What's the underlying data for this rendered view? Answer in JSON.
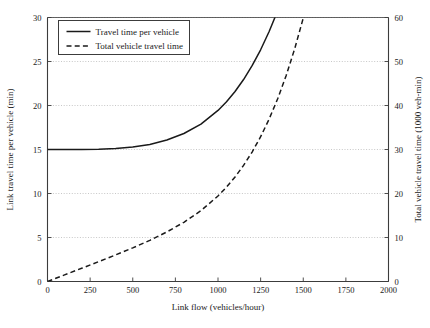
{
  "chart_data": {
    "type": "line",
    "title": "",
    "subtitle": "",
    "xlabel": "Link flow (vehicles/hour)",
    "ylabel": "Link travel time per vehicle (min)",
    "y2label": "Total vehicle travel time (1000 veh-min)",
    "xlim": [
      0,
      2000
    ],
    "ylim": [
      0,
      30
    ],
    "y2lim": [
      0,
      60
    ],
    "xticks": [
      0,
      250,
      500,
      750,
      1000,
      1250,
      1500,
      1750,
      2000
    ],
    "xticklabels": [
      "0",
      "250",
      "500",
      "750",
      "1000",
      "1250",
      "1500",
      "1750",
      "2000"
    ],
    "yticks": [
      0,
      5,
      10,
      15,
      20,
      25,
      30
    ],
    "yticklabels": [
      "0",
      "5",
      "10",
      "15",
      "20",
      "25",
      "30"
    ],
    "y2ticks": [
      0,
      10,
      20,
      30,
      40,
      50,
      60
    ],
    "y2ticklabels": [
      "0",
      "10",
      "20",
      "30",
      "40",
      "50",
      "60"
    ],
    "grid": true,
    "grid_style": "dotted-horizontal",
    "legend_position": "top-left",
    "legend": [
      "Travel time per vehicle",
      "Total vehicle travel time"
    ],
    "series": [
      {
        "name": "Travel time per vehicle",
        "axis": "left",
        "style": "solid",
        "color": "#1a1a1a",
        "x": [
          0,
          100,
          200,
          300,
          400,
          500,
          600,
          700,
          800,
          900,
          1000,
          1050,
          1100,
          1150,
          1200,
          1250,
          1300,
          1350,
          1400,
          1450,
          1500,
          1550,
          1600,
          1610
        ],
        "y": [
          15.0,
          15.0,
          15.01,
          15.04,
          15.12,
          15.28,
          15.58,
          16.08,
          16.82,
          17.89,
          19.44,
          20.43,
          21.59,
          22.95,
          24.52,
          26.33,
          28.41,
          30.77,
          33.46,
          36.49,
          39.91,
          43.73,
          48.0,
          48.93
        ]
      },
      {
        "name": "Total vehicle travel time",
        "axis": "right",
        "style": "dashed",
        "color": "#1a1a1a",
        "x": [
          0,
          100,
          200,
          300,
          400,
          500,
          600,
          700,
          800,
          900,
          1000,
          1050,
          1100,
          1150,
          1200,
          1250,
          1300,
          1350,
          1400,
          1450,
          1500,
          1550,
          1600,
          1650,
          1700,
          1730
        ],
        "y": [
          0.0,
          1.5,
          3.0,
          4.51,
          6.05,
          7.64,
          9.35,
          11.26,
          13.46,
          16.1,
          19.44,
          21.45,
          23.75,
          26.39,
          29.42,
          32.91,
          36.93,
          41.53,
          46.84,
          52.91,
          59.87,
          67.78,
          76.8,
          87.02,
          98.56,
          106.0
        ]
      }
    ]
  },
  "axes": {
    "x_title": "Link flow (vehicles/hour)",
    "y_left_title": "Link travel time per vehicle (min)",
    "y_right_title": "Total vehicle travel time (1000 veh-min)"
  },
  "legend": {
    "items": [
      {
        "label": "Travel time per vehicle",
        "style": "solid"
      },
      {
        "label": "Total vehicle travel time",
        "style": "dashed"
      }
    ]
  },
  "colors": {
    "line": "#1a1a1a",
    "axis": "#3c3c3c",
    "grid": "#b9b9b9",
    "background": "#ffffff"
  }
}
